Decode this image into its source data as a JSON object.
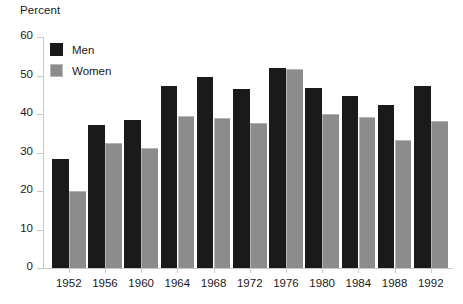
{
  "chart_data": {
    "type": "bar",
    "title": "",
    "subtitle": "",
    "xlabel": "",
    "ylabel": "Percent",
    "ylim": [
      0,
      60
    ],
    "yticks": [
      0,
      10,
      20,
      30,
      40,
      50,
      60
    ],
    "grid": false,
    "legend_position": "top-left",
    "categories": [
      "1952",
      "1956",
      "1960",
      "1964",
      "1968",
      "1972",
      "1976",
      "1980",
      "1984",
      "1988",
      "1992"
    ],
    "series": [
      {
        "name": "Men",
        "color": "#1a1a1a",
        "values": [
          28.3,
          37.1,
          38.4,
          47.3,
          49.5,
          46.5,
          52.0,
          46.8,
          44.8,
          42.4,
          47.2
        ]
      },
      {
        "name": "Women",
        "color": "#8c8c8c",
        "values": [
          20.0,
          32.5,
          31.2,
          39.5,
          39.0,
          37.7,
          51.7,
          40.0,
          39.3,
          33.2,
          38.2
        ]
      }
    ]
  },
  "axis": {
    "y_title": "Percent"
  },
  "legend": {
    "items": [
      {
        "label": "Men"
      },
      {
        "label": "Women"
      }
    ]
  }
}
